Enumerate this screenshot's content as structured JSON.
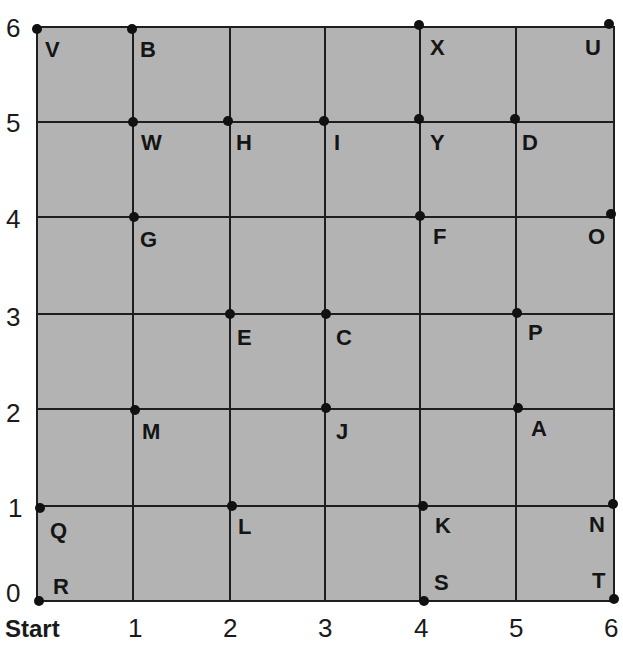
{
  "diagram": {
    "type": "coordinate-grid",
    "background_color": "#b3b3b3",
    "line_color": "#1e1e1e",
    "x_axis": {
      "ticks": [
        "1",
        "2",
        "3",
        "4",
        "5",
        "6"
      ],
      "origin_label": "Start"
    },
    "y_axis": {
      "ticks": [
        "0",
        "1",
        "2",
        "3",
        "4",
        "5",
        "6"
      ]
    },
    "points": [
      {
        "label": "V",
        "x": 0,
        "y": 6
      },
      {
        "label": "B",
        "x": 1,
        "y": 6
      },
      {
        "label": "X",
        "x": 4,
        "y": 6
      },
      {
        "label": "U",
        "x": 6,
        "y": 6
      },
      {
        "label": "W",
        "x": 1,
        "y": 5
      },
      {
        "label": "H",
        "x": 2,
        "y": 5
      },
      {
        "label": "I",
        "x": 3,
        "y": 5
      },
      {
        "label": "Y",
        "x": 4,
        "y": 5
      },
      {
        "label": "D",
        "x": 5,
        "y": 5
      },
      {
        "label": "G",
        "x": 1,
        "y": 4
      },
      {
        "label": "F",
        "x": 4,
        "y": 4
      },
      {
        "label": "O",
        "x": 6,
        "y": 4
      },
      {
        "label": "E",
        "x": 2,
        "y": 3
      },
      {
        "label": "C",
        "x": 3,
        "y": 3
      },
      {
        "label": "P",
        "x": 5,
        "y": 3
      },
      {
        "label": "M",
        "x": 1,
        "y": 2
      },
      {
        "label": "J",
        "x": 3,
        "y": 2
      },
      {
        "label": "A",
        "x": 5,
        "y": 2
      },
      {
        "label": "Q",
        "x": 0,
        "y": 1
      },
      {
        "label": "L",
        "x": 2,
        "y": 1
      },
      {
        "label": "K",
        "x": 4,
        "y": 1
      },
      {
        "label": "N",
        "x": 6,
        "y": 1
      },
      {
        "label": "R",
        "x": 0,
        "y": 0
      },
      {
        "label": "S",
        "x": 4,
        "y": 0
      },
      {
        "label": "T",
        "x": 6,
        "y": 0
      }
    ]
  }
}
